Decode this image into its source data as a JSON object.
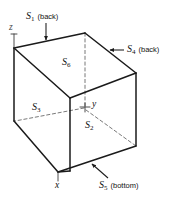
{
  "figure": {
    "kind": "cube-surface-diagram",
    "caption": "",
    "stroke_color": "#1a1a1a",
    "dashed_color": "#555555",
    "background": "#ffffff"
  },
  "axes": [
    {
      "id": "z",
      "label": "z",
      "position": "top-left"
    },
    {
      "id": "y",
      "label": "y",
      "position": "center"
    },
    {
      "id": "x",
      "label": "x",
      "position": "bottom-front"
    }
  ],
  "faces": [
    {
      "id": "S1",
      "symbol": "S",
      "subscript": "1",
      "note": "(back)",
      "kind": "callout"
    },
    {
      "id": "S2",
      "symbol": "S",
      "subscript": "2",
      "note": "",
      "kind": "inline"
    },
    {
      "id": "S3",
      "symbol": "S",
      "subscript": "3",
      "note": "",
      "kind": "inline"
    },
    {
      "id": "S4",
      "symbol": "S",
      "subscript": "4",
      "note": "(back)",
      "kind": "callout"
    },
    {
      "id": "S5",
      "symbol": "S",
      "subscript": "5",
      "note": "(bottom)",
      "kind": "callout"
    },
    {
      "id": "S6",
      "symbol": "S",
      "subscript": "6",
      "note": "",
      "kind": "inline"
    }
  ],
  "labels": {
    "s1_sym": "S",
    "s1_sub": "1",
    "s1_note": "(back)",
    "s2_sym": "S",
    "s2_sub": "2",
    "s3_sym": "S",
    "s3_sub": "3",
    "s4_sym": "S",
    "s4_sub": "4",
    "s4_note": "(back)",
    "s5_sym": "S",
    "s5_sub": "5",
    "s5_note": "(bottom)",
    "s6_sym": "S",
    "s6_sub": "6",
    "axis_z": "z",
    "axis_y": "y",
    "axis_x": "x"
  }
}
